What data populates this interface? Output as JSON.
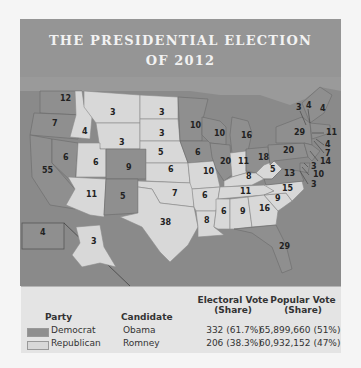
{
  "title": {
    "line1": "THE PRESIDENTIAL ELECTION",
    "line2": "OF 2012"
  },
  "colors": {
    "democrat": "#8f8f8f",
    "republican": "#d8d8d8",
    "ocean": "#8a8a8a",
    "canada": "#9a9a9a"
  },
  "map": {
    "labels": [
      {
        "state": "WA",
        "ev": "12",
        "party": "D",
        "x": 40,
        "y": 24
      },
      {
        "state": "OR",
        "ev": "7",
        "party": "D",
        "x": 32,
        "y": 49
      },
      {
        "state": "CA",
        "ev": "55",
        "party": "D",
        "x": 22,
        "y": 96
      },
      {
        "state": "ID",
        "ev": "4",
        "party": "R",
        "x": 62,
        "y": 57
      },
      {
        "state": "NV",
        "ev": "6",
        "party": "D",
        "x": 43,
        "y": 83
      },
      {
        "state": "MT",
        "ev": "3",
        "party": "R",
        "x": 90,
        "y": 38
      },
      {
        "state": "WY",
        "ev": "3",
        "party": "R",
        "x": 99,
        "y": 68
      },
      {
        "state": "UT",
        "ev": "6",
        "party": "R",
        "x": 73,
        "y": 88
      },
      {
        "state": "CO",
        "ev": "9",
        "party": "D",
        "x": 106,
        "y": 93
      },
      {
        "state": "AZ",
        "ev": "11",
        "party": "R",
        "x": 66,
        "y": 120
      },
      {
        "state": "NM",
        "ev": "5",
        "party": "D",
        "x": 100,
        "y": 122
      },
      {
        "state": "ND",
        "ev": "3",
        "party": "R",
        "x": 139,
        "y": 38
      },
      {
        "state": "SD",
        "ev": "3",
        "party": "R",
        "x": 139,
        "y": 59
      },
      {
        "state": "NE",
        "ev": "5",
        "party": "R",
        "x": 138,
        "y": 78
      },
      {
        "state": "KS",
        "ev": "6",
        "party": "R",
        "x": 148,
        "y": 95
      },
      {
        "state": "OK",
        "ev": "7",
        "party": "R",
        "x": 152,
        "y": 119
      },
      {
        "state": "TX",
        "ev": "38",
        "party": "R",
        "x": 140,
        "y": 148
      },
      {
        "state": "MN",
        "ev": "10",
        "party": "D",
        "x": 170,
        "y": 51
      },
      {
        "state": "IA",
        "ev": "6",
        "party": "D",
        "x": 175,
        "y": 78
      },
      {
        "state": "MO",
        "ev": "10",
        "party": "R",
        "x": 183,
        "y": 97
      },
      {
        "state": "AR",
        "ev": "6",
        "party": "R",
        "x": 182,
        "y": 121
      },
      {
        "state": "LA",
        "ev": "8",
        "party": "R",
        "x": 184,
        "y": 146
      },
      {
        "state": "WI",
        "ev": "10",
        "party": "D",
        "x": 194,
        "y": 59
      },
      {
        "state": "IL",
        "ev": "20",
        "party": "D",
        "x": 200,
        "y": 87
      },
      {
        "state": "MI",
        "ev": "16",
        "party": "D",
        "x": 221,
        "y": 61
      },
      {
        "state": "IN",
        "ev": "11",
        "party": "R",
        "x": 218,
        "y": 87
      },
      {
        "state": "OH",
        "ev": "18",
        "party": "D",
        "x": 238,
        "y": 83
      },
      {
        "state": "KY",
        "ev": "8",
        "party": "R",
        "x": 226,
        "y": 102
      },
      {
        "state": "TN",
        "ev": "11",
        "party": "R",
        "x": 220,
        "y": 117
      },
      {
        "state": "MS",
        "ev": "6",
        "party": "R",
        "x": 201,
        "y": 137
      },
      {
        "state": "AL",
        "ev": "9",
        "party": "R",
        "x": 220,
        "y": 137
      },
      {
        "state": "GA",
        "ev": "16",
        "party": "R",
        "x": 239,
        "y": 134
      },
      {
        "state": "FL",
        "ev": "29",
        "party": "D",
        "x": 259,
        "y": 172
      },
      {
        "state": "SC",
        "ev": "9",
        "party": "R",
        "x": 255,
        "y": 124
      },
      {
        "state": "NC",
        "ev": "15",
        "party": "R",
        "x": 262,
        "y": 114
      },
      {
        "state": "WV",
        "ev": "5",
        "party": "R",
        "x": 250,
        "y": 95
      },
      {
        "state": "VA",
        "ev": "13",
        "party": "D",
        "x": 264,
        "y": 99
      },
      {
        "state": "PA",
        "ev": "20",
        "party": "D",
        "x": 263,
        "y": 76
      },
      {
        "state": "NY",
        "ev": "29",
        "party": "D",
        "x": 274,
        "y": 58
      },
      {
        "state": "VT",
        "ev": "3",
        "party": "D",
        "x": 276,
        "y": 33
      },
      {
        "state": "NH",
        "ev": "4",
        "party": "D",
        "x": 286,
        "y": 31
      },
      {
        "state": "ME",
        "ev": "4",
        "party": "D",
        "x": 300,
        "y": 34
      },
      {
        "state": "MA",
        "ev": "11",
        "party": "D",
        "x": 306,
        "y": 58
      },
      {
        "state": "RI",
        "ev": "4",
        "party": "D",
        "x": 305,
        "y": 70
      },
      {
        "state": "CT",
        "ev": "7",
        "party": "D",
        "x": 305,
        "y": 79
      },
      {
        "state": "NJ",
        "ev": "14",
        "party": "D",
        "x": 300,
        "y": 87
      },
      {
        "state": "DE",
        "ev": "3",
        "party": "D",
        "x": 291,
        "y": 92
      },
      {
        "state": "MD",
        "ev": "10",
        "party": "D",
        "x": 293,
        "y": 100
      },
      {
        "state": "DC",
        "ev": "3",
        "party": "D",
        "x": 291,
        "y": 110
      },
      {
        "state": "HI",
        "ev": "4",
        "party": "D",
        "x": 20,
        "y": 158
      },
      {
        "state": "AK",
        "ev": "3",
        "party": "R",
        "x": 71,
        "y": 167
      }
    ]
  },
  "legend": {
    "headers": {
      "party": "Party",
      "candidate": "Candidate",
      "electoral_line1": "Electoral Vote",
      "electoral_line2": "(Share)",
      "popular_line1": "Popular Vote",
      "popular_line2": "(Share)"
    },
    "rows": [
      {
        "party": "Democrat",
        "candidate": "Obama",
        "electoral": "332 (61.7%)",
        "popular": "65,899,660 (51%)",
        "swatch": "#8f8f8f"
      },
      {
        "party": "Republican",
        "candidate": "Romney",
        "electoral": "206 (38.3%)",
        "popular": "60,932,152 (47%)",
        "swatch": "#d8d8d8"
      }
    ]
  }
}
